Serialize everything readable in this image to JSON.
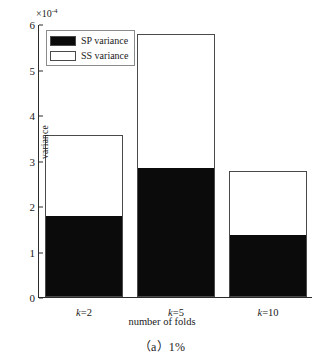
{
  "chart_data": {
    "type": "bar",
    "title": "",
    "subtitle": "",
    "xlabel": "number of folds",
    "ylabel": "variance",
    "exponent_mantissa": "×10",
    "exponent_power": "-4",
    "axis_multiplier": "×10⁻⁴",
    "categories": [
      "k=2",
      "k=5",
      "k=10"
    ],
    "category_labels_italic_var": [
      "k",
      "k",
      "k"
    ],
    "stacked": true,
    "grid": false,
    "ylim": [
      0,
      6
    ],
    "yticks": [
      0,
      1,
      2,
      3,
      4,
      5,
      6
    ],
    "ytick_labels": [
      "0",
      "1",
      "2",
      "3",
      "4",
      "5",
      "6"
    ],
    "legend_position": "upper-left",
    "series": [
      {
        "name": "SP variance",
        "color": "#0b0b0b",
        "values": [
          1.76,
          2.81,
          1.34
        ]
      },
      {
        "name": "SS variance",
        "color": "#ffffff",
        "values": [
          1.79,
          2.97,
          1.42
        ]
      }
    ],
    "totals": [
      3.55,
      5.78,
      2.76
    ]
  },
  "legend": {
    "items": [
      {
        "label": "SP variance",
        "swatch": "#0b0b0b"
      },
      {
        "label": "SS variance",
        "swatch": "#ffffff"
      }
    ]
  },
  "caption": {
    "text": "（a）1%"
  }
}
